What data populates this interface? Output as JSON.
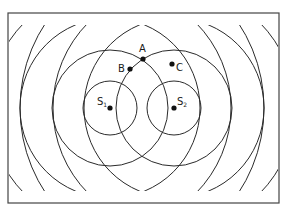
{
  "diagram": {
    "frame": {
      "x": 8,
      "y": 13,
      "width": 271,
      "height": 190,
      "stroke": "#444444"
    },
    "clip": {
      "x": 9,
      "y": 25,
      "width": 269,
      "height": 166
    },
    "line_color": "#2a2a2a",
    "sources": [
      {
        "id": "S1",
        "label": "S",
        "subscript": "1",
        "cx": 110,
        "cy": 108,
        "label_x": 97,
        "label_y": 105
      },
      {
        "id": "S2",
        "label": "S",
        "subscript": "2",
        "cx": 174,
        "cy": 108,
        "label_x": 177,
        "label_y": 105
      }
    ],
    "wavefront_radii": [
      27,
      58,
      90,
      121,
      154
    ],
    "points": [
      {
        "id": "A",
        "label": "A",
        "cx": 143,
        "cy": 59,
        "label_x": 139,
        "label_y": 52
      },
      {
        "id": "B",
        "label": "B",
        "cx": 130,
        "cy": 69,
        "label_x": 118,
        "label_y": 72
      },
      {
        "id": "C",
        "label": "C",
        "cx": 172,
        "cy": 64,
        "label_x": 176,
        "label_y": 71
      }
    ]
  }
}
